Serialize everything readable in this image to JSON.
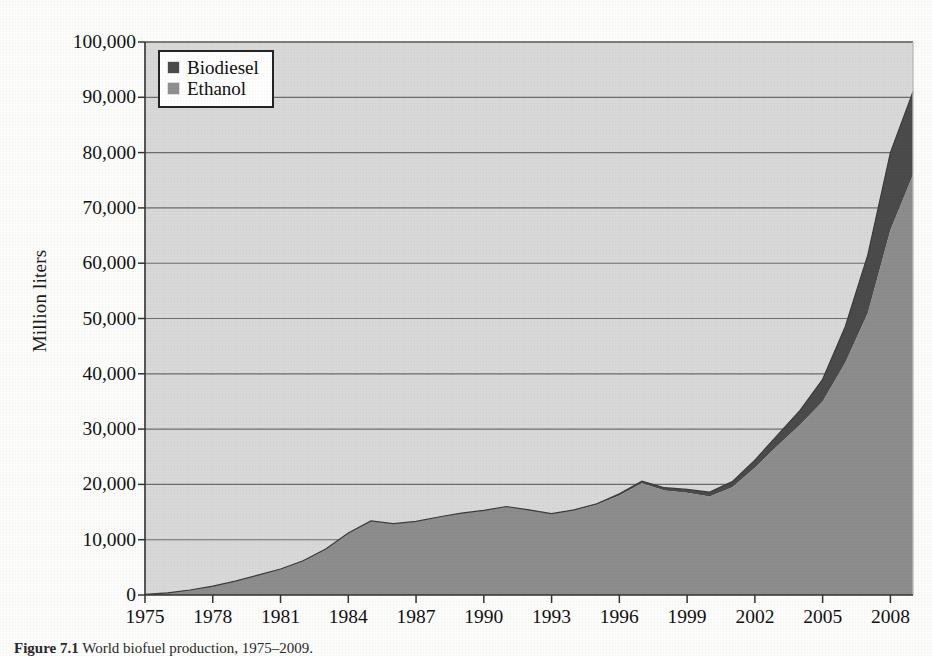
{
  "figure": {
    "caption_prefix": "Figure",
    "caption_number": "7.1",
    "caption_text": "World biofuel production, 1975–2009."
  },
  "axes": {
    "ylabel": "Million liters",
    "yticks": [
      0,
      10000,
      20000,
      30000,
      40000,
      50000,
      60000,
      70000,
      80000,
      90000,
      100000
    ],
    "ytick_labels": [
      "0",
      "10,000",
      "20,000",
      "30,000",
      "40,000",
      "50,000",
      "60,000",
      "70,000",
      "80,000",
      "90,000",
      "100,000"
    ],
    "xtick_labels": [
      "1975",
      "1978",
      "1981",
      "1984",
      "1987",
      "1990",
      "1993",
      "1996",
      "1999",
      "2002",
      "2005",
      "2008"
    ],
    "xticks": [
      1975,
      1978,
      1981,
      1984,
      1987,
      1990,
      1993,
      1996,
      1999,
      2002,
      2005,
      2008
    ],
    "xlim": [
      1975,
      2009
    ],
    "ylim": [
      0,
      100000
    ]
  },
  "legend": {
    "position": "top-left-inside",
    "items": [
      {
        "label": "Biodiesel",
        "color": "#4b4b4b"
      },
      {
        "label": "Ethanol",
        "color": "#909090"
      }
    ]
  },
  "colors": {
    "plot_background": "#d9d9d9",
    "ethanol_fill": "#8d8d8d",
    "biodiesel_fill": "#4b4b4b",
    "gridline": "#6d6d6d",
    "axis": "#333333",
    "page_background": "#fdfdfc"
  },
  "chart_data": {
    "type": "area",
    "stacked": true,
    "title": "",
    "xlabel": "",
    "ylabel": "Million liters",
    "xlim": [
      1975,
      2009
    ],
    "ylim": [
      0,
      100000
    ],
    "grid": true,
    "legend_position": "top-left-inside",
    "x": [
      1975,
      1976,
      1977,
      1978,
      1979,
      1980,
      1981,
      1982,
      1983,
      1984,
      1985,
      1986,
      1987,
      1988,
      1989,
      1990,
      1991,
      1992,
      1993,
      1994,
      1995,
      1996,
      1997,
      1998,
      1999,
      2000,
      2001,
      2002,
      2003,
      2004,
      2005,
      2006,
      2007,
      2008,
      2009
    ],
    "series": [
      {
        "name": "Ethanol",
        "color": "#8d8d8d",
        "values": [
          100,
          400,
          900,
          1600,
          2500,
          3600,
          4700,
          6200,
          8300,
          11200,
          13400,
          12900,
          13300,
          14100,
          14800,
          15300,
          16000,
          15400,
          14700,
          15300,
          16300,
          18000,
          20200,
          18900,
          18500,
          17800,
          19500,
          23000,
          27000,
          30800,
          35000,
          42000,
          51000,
          66000,
          76000
        ]
      },
      {
        "name": "Biodiesel",
        "color": "#4b4b4b",
        "values": [
          0,
          0,
          0,
          0,
          0,
          0,
          0,
          0,
          0,
          0,
          0,
          0,
          0,
          0,
          0,
          0,
          0,
          0,
          0,
          100,
          200,
          300,
          400,
          500,
          600,
          800,
          1000,
          1400,
          1900,
          2600,
          4000,
          6500,
          10500,
          14000,
          15000
        ]
      }
    ],
    "totals": [
      100,
      400,
      900,
      1600,
      2500,
      3600,
      4700,
      6200,
      8300,
      11200,
      13400,
      12900,
      13300,
      14100,
      14800,
      15300,
      16000,
      15400,
      14700,
      15400,
      16500,
      18300,
      20600,
      19400,
      19100,
      18600,
      20500,
      24400,
      28900,
      33400,
      39000,
      48500,
      61500,
      80000,
      91000
    ]
  }
}
